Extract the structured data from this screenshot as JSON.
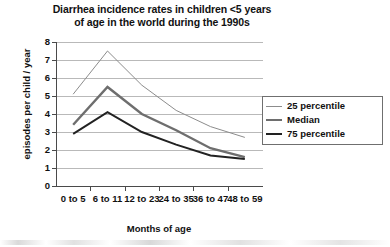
{
  "chart_data": {
    "type": "line",
    "title": "Diarrhea incidence rates in children <5 years of age in the world during the 1990s",
    "title_line1": "Diarrhea incidence rates in children <5 years",
    "title_line2": "of age in the world during the 1990s",
    "xlabel": "Months of age",
    "ylabel": "episodes per child / year",
    "categories": [
      "0 to 5",
      "6 to 11",
      "12 to 23",
      "24 to 35",
      "36 to 47",
      "48 to 59"
    ],
    "ylim": [
      0,
      8
    ],
    "yticks": [
      0,
      1,
      2,
      3,
      4,
      5,
      6,
      7,
      8
    ],
    "ytick_labels": [
      "0",
      "1",
      "2",
      "3",
      "4",
      "5",
      "6",
      "7",
      "8"
    ],
    "grid": true,
    "grid_axis": "y",
    "legend_position": "right",
    "series": [
      {
        "name": "25 percentile",
        "color": "#8c8c8c",
        "width": 1.0,
        "values": [
          5.1,
          7.5,
          5.6,
          4.2,
          3.3,
          2.7
        ]
      },
      {
        "name": "Median",
        "color": "#6e6e6e",
        "width": 2.4,
        "values": [
          3.4,
          5.5,
          4.0,
          3.1,
          2.1,
          1.6
        ]
      },
      {
        "name": "75 percentile",
        "color": "#222222",
        "width": 2.0,
        "values": [
          2.9,
          4.1,
          3.0,
          2.3,
          1.7,
          1.5
        ]
      }
    ]
  },
  "legend": {
    "items": [
      {
        "label": "25 percentile"
      },
      {
        "label": "Median"
      },
      {
        "label": "75 percentile"
      }
    ]
  }
}
